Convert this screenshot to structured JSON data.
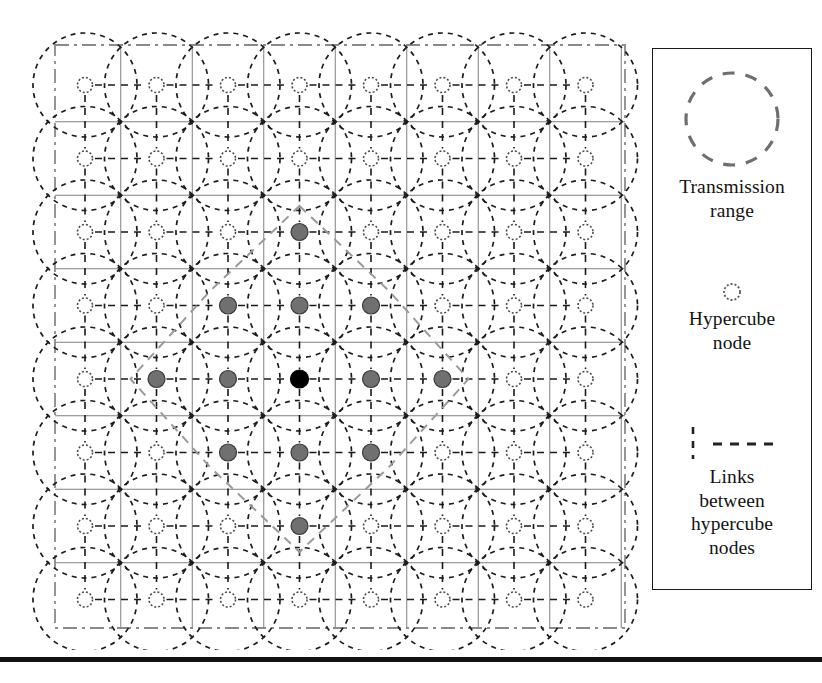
{
  "figure": {
    "kind": "network-topology-diagram"
  },
  "legend": {
    "border_color": "#1a1a1a",
    "entries": [
      {
        "id": "transmission-range",
        "swatch": "dashed-circle",
        "swatch_color": "#6f6f6f",
        "label": "Transmission\nrange",
        "lines": [
          "Transmission",
          "range"
        ]
      },
      {
        "id": "hypercube-node",
        "swatch": "small-dotted-circle",
        "swatch_color": "#555555",
        "label": "Hypercube\nnode",
        "lines": [
          "Hypercube",
          "node"
        ]
      },
      {
        "id": "links-between-hypercube-nodes",
        "swatch": "dashed-link-pair",
        "swatch_color": "#222222",
        "label": "Links\nbetween\nhypercube\nnodes",
        "lines": [
          "Links",
          "between",
          "hypercube",
          "nodes"
        ]
      }
    ]
  },
  "network": {
    "grid": {
      "cols": 8,
      "rows": 8,
      "origin_x": 85,
      "origin_y": 85,
      "spacing_x": 71.5,
      "spacing_y": 73.5,
      "cell_line_color": "#808080",
      "boundary_style": "dash-dot",
      "boundary_color": "#8a8a8a",
      "boundary": {
        "x": 55,
        "y": 45,
        "width": 570,
        "height": 583
      }
    },
    "transmission_circle": {
      "radius": 52,
      "color": "#1c1c1c",
      "dash": "5 5"
    },
    "node_styles": {
      "plain": {
        "fill": "#ffffff",
        "stroke": "#4a4a4a",
        "radius": 7.5,
        "dash": "2 2"
      },
      "highlight": {
        "fill": "#707070",
        "stroke": "#3a3a3a",
        "radius": 8.5
      },
      "source": {
        "fill": "#000000",
        "stroke": "#000000",
        "radius": 9
      }
    },
    "link_style": {
      "color": "#1a1a1a",
      "dash": "7 6",
      "width": 1.6
    },
    "highlight_outline": {
      "color": "#9a9a9a",
      "dash": "9 7",
      "width": 2
    },
    "source_node": {
      "col": 3,
      "row": 4
    },
    "highlighted_nodes": [
      {
        "col": 3,
        "row": 2
      },
      {
        "col": 2,
        "row": 3
      },
      {
        "col": 3,
        "row": 3
      },
      {
        "col": 4,
        "row": 3
      },
      {
        "col": 1,
        "row": 4
      },
      {
        "col": 2,
        "row": 4
      },
      {
        "col": 4,
        "row": 4
      },
      {
        "col": 5,
        "row": 4
      },
      {
        "col": 2,
        "row": 5
      },
      {
        "col": 3,
        "row": 5
      },
      {
        "col": 4,
        "row": 5
      },
      {
        "col": 3,
        "row": 6
      }
    ]
  },
  "bottom_rule": {
    "color": "#111111",
    "height": 5
  }
}
